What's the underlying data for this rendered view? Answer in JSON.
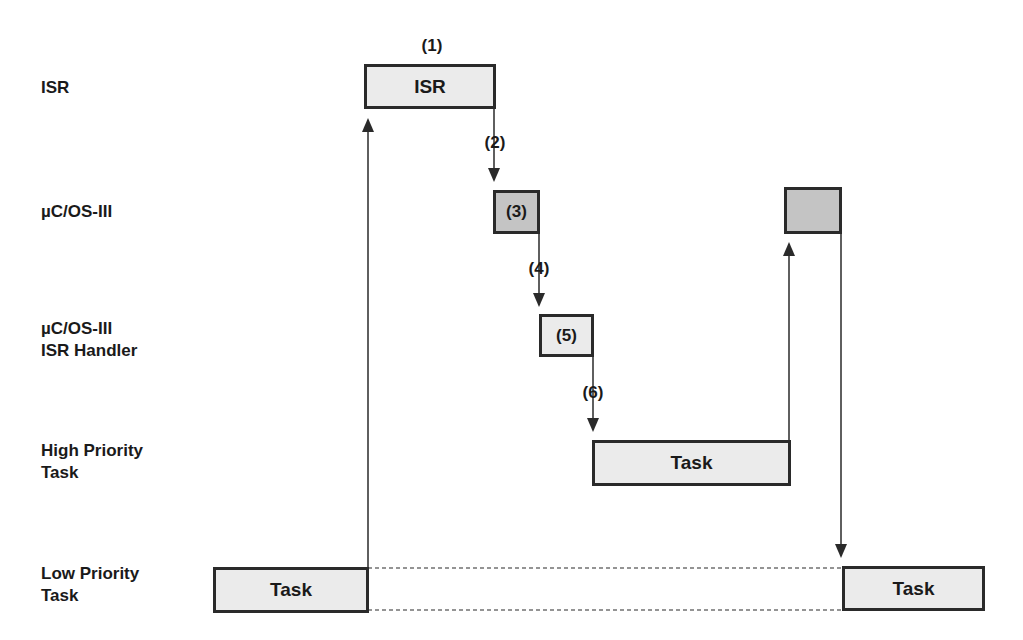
{
  "rows": [
    {
      "id": "isr",
      "label": "ISR"
    },
    {
      "id": "kernel",
      "label": "µC/OS-III"
    },
    {
      "id": "isr_handler",
      "label_line1": "µC/OS-III",
      "label_line2": "ISR Handler"
    },
    {
      "id": "high_task",
      "label_line1": "High Priority",
      "label_line2": "Task"
    },
    {
      "id": "low_task",
      "label_line1": "Low Priority",
      "label_line2": "Task"
    }
  ],
  "boxes": {
    "isr": "ISR",
    "kernel_step": "(3)",
    "handler_step": "(5)",
    "high_task": "Task",
    "low_task_left": "Task",
    "low_task_right": "Task",
    "kernel_return": ""
  },
  "steps": {
    "s1": "(1)",
    "s2": "(2)",
    "s4": "(4)",
    "s6": "(6)"
  },
  "colors": {
    "box_fill": "#ebebeb",
    "box_dark_fill": "#c4c4c4",
    "stroke": "#2a2a2a"
  }
}
